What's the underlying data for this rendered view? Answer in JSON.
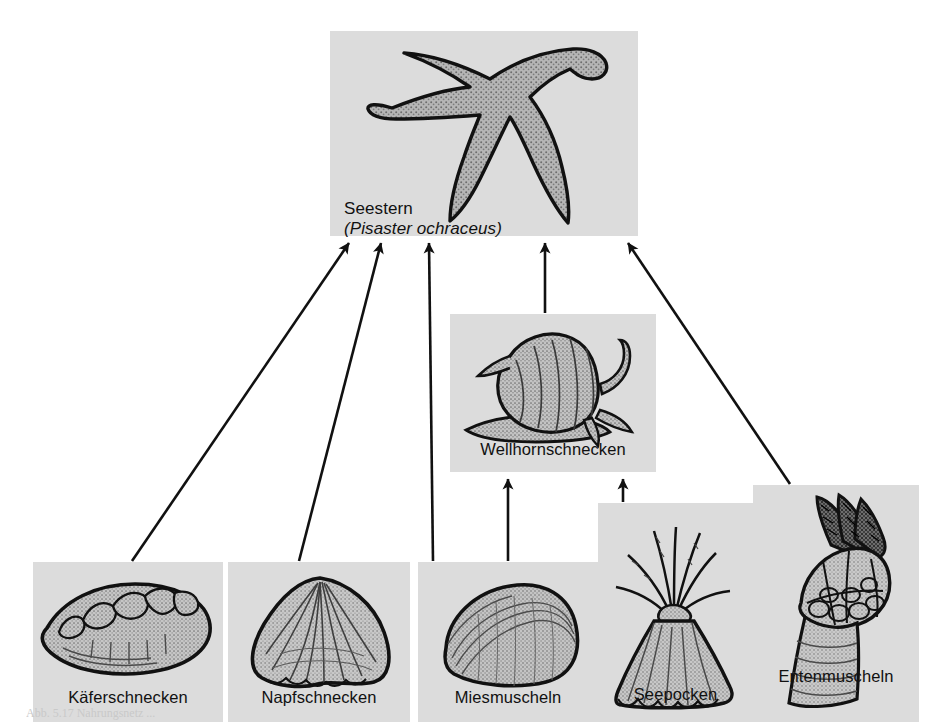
{
  "figure": {
    "type": "food-web-diagram",
    "language": "de",
    "background_color": "#ffffff",
    "panel_color": "#dcdcdc",
    "ink_color": "#111111",
    "clipped_note": "Abb. 5.17  Nahrungsnetz ..."
  },
  "apex": {
    "id": "seestern",
    "label": "Seestern",
    "scientific_name": "(Pisaster ochraceus)",
    "icon": "starfish-icon",
    "incoming_arrows": 5
  },
  "intermediate": [
    {
      "id": "wellhornschnecken",
      "label": "Wellhornschnecken",
      "icon": "whelk-snail-icon",
      "prey": [
        "miesmuscheln",
        "seepocken"
      ],
      "predator": "seestern"
    }
  ],
  "basal": [
    {
      "id": "kaeferschnecken",
      "label": "Käferschnecken",
      "icon": "chiton-icon",
      "predator": "seestern"
    },
    {
      "id": "napfschnecken",
      "label": "Napfschnecken",
      "icon": "limpet-icon",
      "predator": "seestern"
    },
    {
      "id": "miesmuscheln",
      "label": "Miesmuscheln",
      "icon": "mussel-icon",
      "predator": "seestern, wellhornschnecken"
    },
    {
      "id": "seepocken",
      "label": "Seepocken",
      "icon": "barnacle-icon",
      "predator": "wellhornschnecken"
    },
    {
      "id": "entenmuscheln",
      "label": "Entenmuscheln",
      "icon": "goose-barnacle-icon",
      "predator": "seestern"
    }
  ],
  "edges": [
    {
      "from": "kaeferschnecken",
      "to": "seestern",
      "style": "diagonal"
    },
    {
      "from": "napfschnecken",
      "to": "seestern",
      "style": "diagonal"
    },
    {
      "from": "miesmuscheln",
      "to": "seestern",
      "style": "vertical"
    },
    {
      "from": "wellhornschnecken",
      "to": "seestern",
      "style": "vertical"
    },
    {
      "from": "entenmuscheln",
      "to": "seestern",
      "style": "diagonal"
    },
    {
      "from": "miesmuscheln",
      "to": "wellhornschnecken",
      "style": "vertical"
    },
    {
      "from": "seepocken",
      "to": "wellhornschnecken",
      "style": "vertical"
    }
  ]
}
